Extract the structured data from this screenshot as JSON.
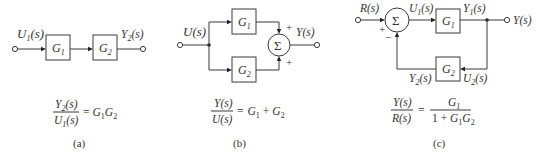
{
  "panels": {
    "a": {
      "input_label": "U",
      "input_sub": "1",
      "input_arg": "(s)",
      "block1": "G",
      "block1_sub": "1",
      "block2": "G",
      "block2_sub": "2",
      "output_label": "Y",
      "output_sub": "2",
      "output_arg": "(s)",
      "eq_num": "Y",
      "eq_num_sub": "2",
      "eq_num_arg": "(s)",
      "eq_den": "U",
      "eq_den_sub": "1",
      "eq_den_arg": "(s)",
      "eq_rhs_eq": "=",
      "eq_rhs_g1": "G",
      "eq_rhs_g1_sub": "1",
      "eq_rhs_g2": "G",
      "eq_rhs_g2_sub": "2",
      "caption": "(a)"
    },
    "b": {
      "input_label": "U(s)",
      "block1": "G",
      "block1_sub": "1",
      "block2": "G",
      "block2_sub": "2",
      "sum_symbol": "Σ",
      "sign_top": "+",
      "sign_bottom": "+",
      "output_label": "Y(s)",
      "eq_num": "Y(s)",
      "eq_den": "U(s)",
      "eq_rhs_eq": "=",
      "eq_rhs_g1": "G",
      "eq_rhs_g1_sub": "1",
      "eq_plus": "+",
      "eq_rhs_g2": "G",
      "eq_rhs_g2_sub": "2",
      "caption": "(b)"
    },
    "c": {
      "input_label": "R(s)",
      "sum_symbol": "Σ",
      "sign_plus": "+",
      "sign_minus": "−",
      "u1_label": "U",
      "u1_sub": "1",
      "u1_arg": "(s)",
      "block1": "G",
      "block1_sub": "1",
      "y1_label": "Y",
      "y1_sub": "1",
      "y1_arg": "(s)",
      "output_label": "Y(s)",
      "block2": "G",
      "block2_sub": "2",
      "y2_label": "Y",
      "y2_sub": "2",
      "y2_arg": "(s)",
      "u2_label": "U",
      "u2_sub": "2",
      "u2_arg": "(s)",
      "eq_num": "Y(s)",
      "eq_den": "R(s)",
      "eq_rhs_eq": "=",
      "eq_frac_num": "G",
      "eq_frac_num_sub": "1",
      "eq_frac_den_prefix": "1 + ",
      "eq_frac_den_g1": "G",
      "eq_frac_den_g1_sub": "1",
      "eq_frac_den_g2": "G",
      "eq_frac_den_g2_sub": "2",
      "caption": "(c)"
    }
  }
}
